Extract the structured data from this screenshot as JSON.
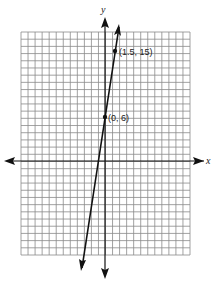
{
  "chart_data": {
    "type": "line",
    "title": "",
    "xlabel": "x",
    "ylabel": "y",
    "grid": true,
    "grid_cols": 24,
    "grid_rows": 31,
    "line": {
      "equation": "y = 6x + 6",
      "slope": 6,
      "intercept": 6
    },
    "points": [
      {
        "label": "(0, 6)",
        "x": 0,
        "y": 6
      },
      {
        "label": "(1.5, 15)",
        "x": 1.5,
        "y": 15
      }
    ],
    "colors": {
      "grid": "#8a8a8a",
      "axes": "#111111",
      "line": "#111111"
    }
  }
}
